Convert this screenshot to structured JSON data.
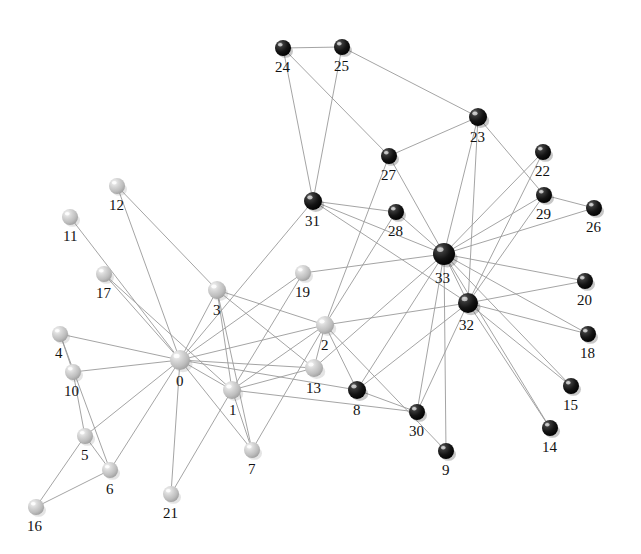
{
  "figure": {
    "kind": "network-graph",
    "background_color": "#ffffff",
    "width": 641,
    "height": 554
  },
  "style": {
    "edge_color": "#9a9a9a",
    "edge_width": 0.9,
    "light_node_color": "#c4c4c4",
    "light_node_highlight": "#f2f2f2",
    "light_node_shadow": "#8d8d8d",
    "dark_node_color": "#1b1b1b",
    "dark_node_highlight": "#d8d8d8",
    "dark_node_shadow": "#000000",
    "label_color": "#111111",
    "label_font_size": 15
  },
  "chart_data": {
    "type": "scatter",
    "title": "",
    "xlabel": "",
    "ylabel": "",
    "grid": false,
    "legend": "none",
    "node_labels": [
      "0",
      "1",
      "2",
      "3",
      "4",
      "5",
      "6",
      "7",
      "8",
      "9",
      "10",
      "11",
      "12",
      "13",
      "14",
      "15",
      "16",
      "17",
      "18",
      "19",
      "20",
      "21",
      "22",
      "23",
      "24",
      "25",
      "26",
      "27",
      "28",
      "29",
      "30",
      "31",
      "32",
      "33"
    ],
    "nodes": [
      {
        "id": "0",
        "x": 180,
        "y": 360,
        "r": 10,
        "group": "light",
        "label": "0",
        "label_dx": -4,
        "label_dy": 12
      },
      {
        "id": "1",
        "x": 232,
        "y": 390,
        "r": 9,
        "group": "light",
        "label": "1",
        "label_dx": -3,
        "label_dy": 12
      },
      {
        "id": "2",
        "x": 325,
        "y": 325,
        "r": 9,
        "group": "light",
        "label": "2",
        "label_dx": -4,
        "label_dy": 12
      },
      {
        "id": "3",
        "x": 217,
        "y": 290,
        "r": 9,
        "group": "light",
        "label": "3",
        "label_dx": -4,
        "label_dy": 12
      },
      {
        "id": "4",
        "x": 60,
        "y": 334,
        "r": 8,
        "group": "light",
        "label": "4",
        "label_dx": -5,
        "label_dy": 12
      },
      {
        "id": "5",
        "x": 85,
        "y": 436,
        "r": 8,
        "group": "light",
        "label": "5",
        "label_dx": -4,
        "label_dy": 12
      },
      {
        "id": "6",
        "x": 110,
        "y": 470,
        "r": 8,
        "group": "light",
        "label": "6",
        "label_dx": -4,
        "label_dy": 12
      },
      {
        "id": "7",
        "x": 252,
        "y": 450,
        "r": 8,
        "group": "light",
        "label": "7",
        "label_dx": -4,
        "label_dy": 12
      },
      {
        "id": "8",
        "x": 357,
        "y": 390,
        "r": 9,
        "group": "dark",
        "label": "8",
        "label_dx": -4,
        "label_dy": 12
      },
      {
        "id": "9",
        "x": 446,
        "y": 451,
        "r": 8,
        "group": "dark",
        "label": "9",
        "label_dx": -4,
        "label_dy": 12
      },
      {
        "id": "10",
        "x": 73,
        "y": 372,
        "r": 8,
        "group": "light",
        "label": "10",
        "label_dx": -9,
        "label_dy": 12
      },
      {
        "id": "11",
        "x": 70,
        "y": 217,
        "r": 8,
        "group": "light",
        "label": "11",
        "label_dx": -7,
        "label_dy": 12
      },
      {
        "id": "12",
        "x": 117,
        "y": 186,
        "r": 8,
        "group": "light",
        "label": "12",
        "label_dx": -8,
        "label_dy": 12
      },
      {
        "id": "13",
        "x": 314,
        "y": 368,
        "r": 9,
        "group": "light",
        "label": "13",
        "label_dx": -8,
        "label_dy": 12
      },
      {
        "id": "14",
        "x": 550,
        "y": 428,
        "r": 8,
        "group": "dark",
        "label": "14",
        "label_dx": -8,
        "label_dy": 12
      },
      {
        "id": "15",
        "x": 571,
        "y": 386,
        "r": 8,
        "group": "dark",
        "label": "15",
        "label_dx": -8,
        "label_dy": 12
      },
      {
        "id": "16",
        "x": 36,
        "y": 507,
        "r": 8,
        "group": "light",
        "label": "16",
        "label_dx": -9,
        "label_dy": 12
      },
      {
        "id": "17",
        "x": 104,
        "y": 274,
        "r": 8,
        "group": "light",
        "label": "17",
        "label_dx": -8,
        "label_dy": 12
      },
      {
        "id": "18",
        "x": 588,
        "y": 334,
        "r": 8,
        "group": "dark",
        "label": "18",
        "label_dx": -8,
        "label_dy": 12
      },
      {
        "id": "19",
        "x": 303,
        "y": 273,
        "r": 8,
        "group": "light",
        "label": "19",
        "label_dx": -8,
        "label_dy": 12
      },
      {
        "id": "20",
        "x": 585,
        "y": 281,
        "r": 8,
        "group": "dark",
        "label": "20",
        "label_dx": -8,
        "label_dy": 12
      },
      {
        "id": "21",
        "x": 171,
        "y": 494,
        "r": 8,
        "group": "light",
        "label": "21",
        "label_dx": -8,
        "label_dy": 12
      },
      {
        "id": "22",
        "x": 543,
        "y": 152,
        "r": 8,
        "group": "dark",
        "label": "22",
        "label_dx": -8,
        "label_dy": 12
      },
      {
        "id": "23",
        "x": 478,
        "y": 117,
        "r": 9,
        "group": "dark",
        "label": "23",
        "label_dx": -8,
        "label_dy": 12
      },
      {
        "id": "24",
        "x": 283,
        "y": 48,
        "r": 8,
        "group": "dark",
        "label": "24",
        "label_dx": -8,
        "label_dy": 12
      },
      {
        "id": "25",
        "x": 342,
        "y": 47,
        "r": 8,
        "group": "dark",
        "label": "25",
        "label_dx": -8,
        "label_dy": 12
      },
      {
        "id": "26",
        "x": 594,
        "y": 208,
        "r": 8,
        "group": "dark",
        "label": "26",
        "label_dx": -8,
        "label_dy": 12
      },
      {
        "id": "27",
        "x": 389,
        "y": 156,
        "r": 8,
        "group": "dark",
        "label": "27",
        "label_dx": -8,
        "label_dy": 12
      },
      {
        "id": "28",
        "x": 396,
        "y": 212,
        "r": 8,
        "group": "dark",
        "label": "28",
        "label_dx": -8,
        "label_dy": 12
      },
      {
        "id": "29",
        "x": 544,
        "y": 195,
        "r": 8,
        "group": "dark",
        "label": "29",
        "label_dx": -8,
        "label_dy": 12
      },
      {
        "id": "30",
        "x": 417,
        "y": 412,
        "r": 8,
        "group": "dark",
        "label": "30",
        "label_dx": -8,
        "label_dy": 12
      },
      {
        "id": "31",
        "x": 313,
        "y": 201,
        "r": 9,
        "group": "dark",
        "label": "31",
        "label_dx": -8,
        "label_dy": 12
      },
      {
        "id": "32",
        "x": 468,
        "y": 303,
        "r": 10,
        "group": "dark",
        "label": "32",
        "label_dx": -9,
        "label_dy": 13
      },
      {
        "id": "33",
        "x": 444,
        "y": 254,
        "r": 11,
        "group": "dark",
        "label": "33",
        "label_dx": -9,
        "label_dy": 14
      }
    ],
    "edges": [
      [
        "0",
        "1"
      ],
      [
        "0",
        "2"
      ],
      [
        "0",
        "3"
      ],
      [
        "0",
        "4"
      ],
      [
        "0",
        "5"
      ],
      [
        "0",
        "6"
      ],
      [
        "0",
        "7"
      ],
      [
        "0",
        "8"
      ],
      [
        "0",
        "10"
      ],
      [
        "0",
        "11"
      ],
      [
        "0",
        "12"
      ],
      [
        "0",
        "13"
      ],
      [
        "0",
        "17"
      ],
      [
        "0",
        "19"
      ],
      [
        "0",
        "21"
      ],
      [
        "0",
        "31"
      ],
      [
        "1",
        "2"
      ],
      [
        "1",
        "3"
      ],
      [
        "1",
        "7"
      ],
      [
        "1",
        "13"
      ],
      [
        "1",
        "17"
      ],
      [
        "1",
        "19"
      ],
      [
        "1",
        "21"
      ],
      [
        "1",
        "30"
      ],
      [
        "2",
        "3"
      ],
      [
        "2",
        "7"
      ],
      [
        "2",
        "8"
      ],
      [
        "2",
        "9"
      ],
      [
        "2",
        "13"
      ],
      [
        "2",
        "27"
      ],
      [
        "2",
        "28"
      ],
      [
        "2",
        "32"
      ],
      [
        "3",
        "7"
      ],
      [
        "3",
        "12"
      ],
      [
        "3",
        "13"
      ],
      [
        "4",
        "6"
      ],
      [
        "4",
        "10"
      ],
      [
        "5",
        "6"
      ],
      [
        "5",
        "10"
      ],
      [
        "5",
        "16"
      ],
      [
        "6",
        "16"
      ],
      [
        "8",
        "30"
      ],
      [
        "8",
        "32"
      ],
      [
        "8",
        "33"
      ],
      [
        "9",
        "33"
      ],
      [
        "13",
        "33"
      ],
      [
        "14",
        "32"
      ],
      [
        "14",
        "33"
      ],
      [
        "15",
        "32"
      ],
      [
        "15",
        "33"
      ],
      [
        "18",
        "32"
      ],
      [
        "18",
        "33"
      ],
      [
        "19",
        "33"
      ],
      [
        "20",
        "32"
      ],
      [
        "20",
        "33"
      ],
      [
        "22",
        "32"
      ],
      [
        "22",
        "33"
      ],
      [
        "23",
        "25"
      ],
      [
        "23",
        "27"
      ],
      [
        "23",
        "29"
      ],
      [
        "23",
        "32"
      ],
      [
        "23",
        "33"
      ],
      [
        "24",
        "25"
      ],
      [
        "24",
        "27"
      ],
      [
        "24",
        "31"
      ],
      [
        "25",
        "31"
      ],
      [
        "26",
        "29"
      ],
      [
        "26",
        "33"
      ],
      [
        "27",
        "33"
      ],
      [
        "28",
        "31"
      ],
      [
        "28",
        "33"
      ],
      [
        "29",
        "32"
      ],
      [
        "29",
        "33"
      ],
      [
        "30",
        "32"
      ],
      [
        "30",
        "33"
      ],
      [
        "31",
        "32"
      ],
      [
        "31",
        "33"
      ],
      [
        "32",
        "33"
      ]
    ]
  }
}
